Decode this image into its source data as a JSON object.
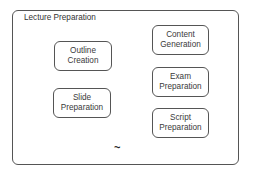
{
  "diagram": {
    "container": {
      "title": "Lecture Preparation"
    },
    "nodes": [
      {
        "id": "outline",
        "label": "Outline\nCreation"
      },
      {
        "id": "slide",
        "label": "Slide\nPreparation"
      },
      {
        "id": "content",
        "label": "Content\nGeneration"
      },
      {
        "id": "exam",
        "label": "Exam\nPreparation"
      },
      {
        "id": "script",
        "label": "Script\nPreparation"
      }
    ],
    "marker": "~"
  }
}
